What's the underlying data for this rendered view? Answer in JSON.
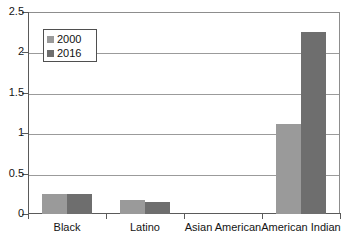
{
  "chart_data": {
    "type": "bar",
    "title": "",
    "subtitle": "",
    "xlabel": "",
    "ylabel": "",
    "categories": [
      "Black",
      "Latino",
      "Asian American",
      "American Indian"
    ],
    "series": [
      {
        "name": "2000",
        "color": "#9a9a9a",
        "values": [
          0.25,
          0.17,
          0.0,
          1.12
        ]
      },
      {
        "name": "2016",
        "color": "#6e6e6e",
        "values": [
          0.25,
          0.15,
          0.0,
          2.25
        ]
      }
    ],
    "ylim": [
      0,
      2.5
    ],
    "yticks": [
      0,
      0.5,
      1,
      1.5,
      2,
      2.5
    ],
    "ytick_labels": [
      "0",
      "0.5",
      "1",
      "1.5",
      "2",
      "2.5"
    ],
    "grid": true,
    "grid_axis": "y",
    "legend_position": "upper-left",
    "legend_entries": [
      "2000",
      "2016"
    ],
    "axis_color": "#5a5a5a",
    "grid_color": "#9b9b9b",
    "background": "#ffffff"
  }
}
